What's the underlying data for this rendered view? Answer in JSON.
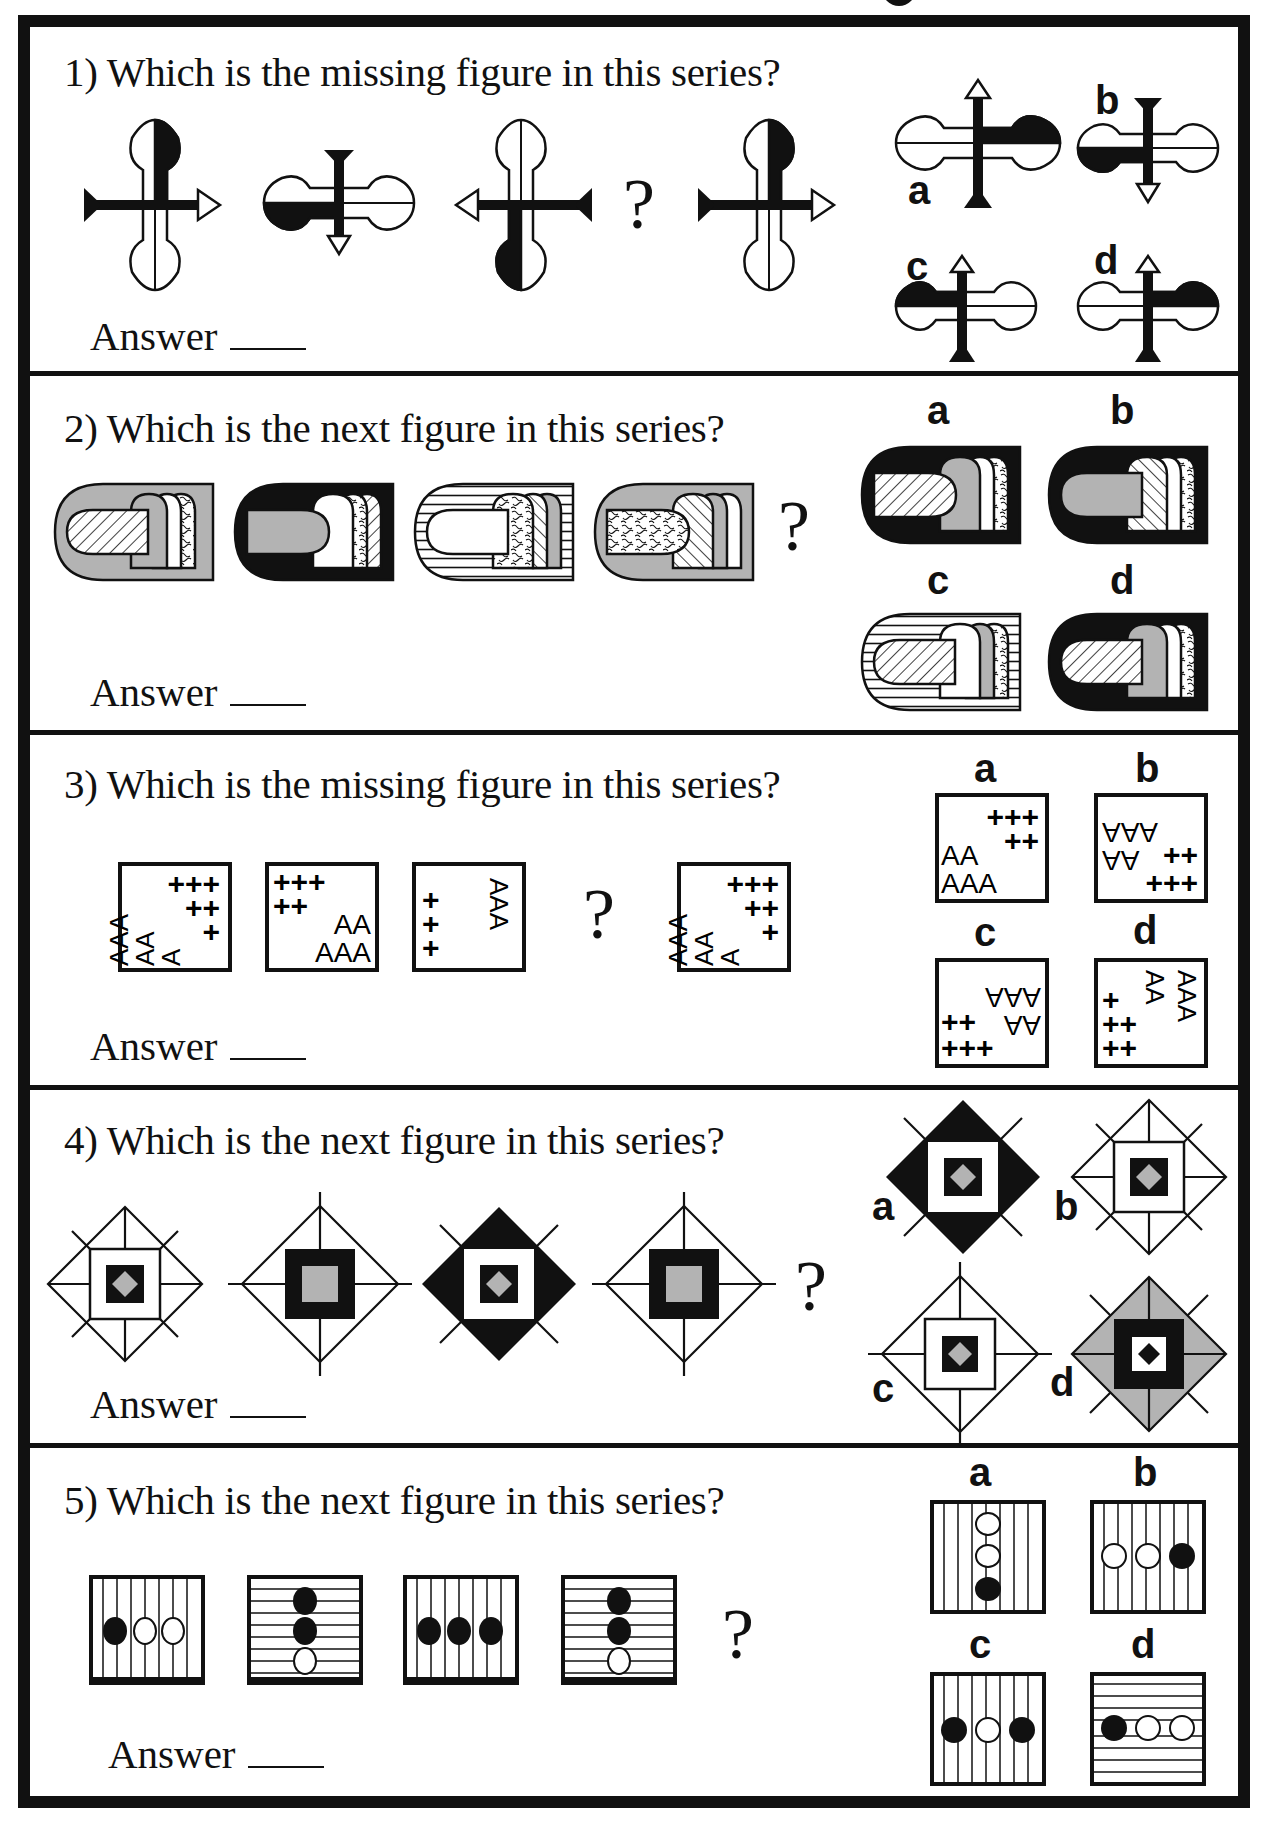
{
  "page": {
    "title_fragment": "g",
    "answer_label": "Answer",
    "question_mark": "?"
  },
  "colors": {
    "ink": "#111111",
    "gray": "#b3b3b3",
    "paper": "#ffffff"
  },
  "questions": [
    {
      "number": "1",
      "text": "1) Which is the missing figure in this series?",
      "series": [
        "figure-1",
        "figure-2",
        "figure-3",
        "?",
        "figure-5"
      ],
      "options": [
        {
          "label": "a"
        },
        {
          "label": "b"
        },
        {
          "label": "c"
        },
        {
          "label": "d"
        }
      ]
    },
    {
      "number": "2",
      "text": "2) Which is the next figure in this series?",
      "series": [
        "figure-1",
        "figure-2",
        "figure-3",
        "figure-4",
        "?"
      ],
      "options": [
        {
          "label": "a"
        },
        {
          "label": "b"
        },
        {
          "label": "c"
        },
        {
          "label": "d"
        }
      ]
    },
    {
      "number": "3",
      "text": "3) Which is the missing figure in this series?",
      "series": [
        "figure-1",
        "figure-2",
        "figure-3",
        "?",
        "figure-5"
      ],
      "figure_text": {
        "plus3": "+++",
        "plus2": "++",
        "plus1": "+",
        "a2": "AA",
        "a3": "AAA",
        "v3": "AAA",
        "v2": "AA"
      },
      "options": [
        {
          "label": "a"
        },
        {
          "label": "b"
        },
        {
          "label": "c"
        },
        {
          "label": "d"
        }
      ]
    },
    {
      "number": "4",
      "text": "4) Which is the next figure in this series?",
      "series": [
        "figure-1",
        "figure-2",
        "figure-3",
        "figure-4",
        "?"
      ],
      "options": [
        {
          "label": "a"
        },
        {
          "label": "b"
        },
        {
          "label": "c"
        },
        {
          "label": "d"
        }
      ]
    },
    {
      "number": "5",
      "text": "5) Which is the next figure in this series?",
      "series": [
        "figure-1",
        "figure-2",
        "figure-3",
        "figure-4",
        "?"
      ],
      "options": [
        {
          "label": "a"
        },
        {
          "label": "b"
        },
        {
          "label": "c"
        },
        {
          "label": "d"
        }
      ]
    }
  ]
}
